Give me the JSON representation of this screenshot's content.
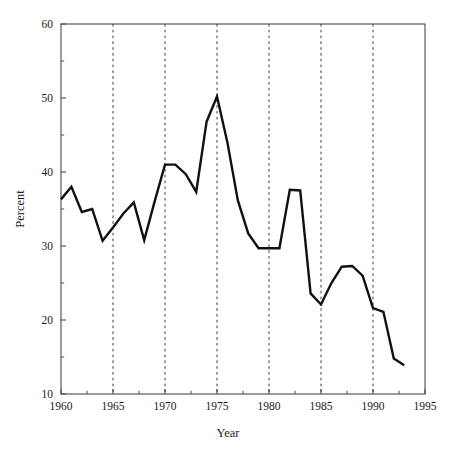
{
  "chart_data": {
    "type": "line",
    "title": "",
    "xlabel": "Year",
    "ylabel": "Percent",
    "xlim": [
      1960,
      1995
    ],
    "ylim": [
      10,
      60
    ],
    "grid": "vertical-dashed-at-major-x-ticks",
    "legend": "none",
    "x_major_ticks": [
      1960,
      1965,
      1970,
      1975,
      1980,
      1985,
      1990,
      1995
    ],
    "x_major_tick_labels": [
      "1960",
      "1965",
      "1970",
      "1975",
      "1980",
      "1985",
      "1990",
      "1995"
    ],
    "x_minor_ticks": [
      1962.5,
      1967.5,
      1972.5,
      1977.5,
      1982.5,
      1987.5,
      1992.5
    ],
    "y_major_ticks": [
      10,
      20,
      30,
      40,
      50,
      60
    ],
    "y_major_tick_labels": [
      "10",
      "20",
      "30",
      "40",
      "50",
      "60"
    ],
    "y_minor_ticks": [
      15,
      25,
      35,
      45,
      55
    ],
    "series": [
      {
        "name": "Percent",
        "color": "#111111",
        "x": [
          1960,
          1961,
          1962,
          1963,
          1964,
          1965,
          1966,
          1967,
          1968,
          1969,
          1970,
          1971,
          1972,
          1973,
          1974,
          1975,
          1976,
          1977,
          1978,
          1979,
          1980,
          1981,
          1982,
          1983,
          1984,
          1985,
          1986,
          1987,
          1988,
          1989,
          1990,
          1991,
          1992,
          1993
        ],
        "values": [
          36.3,
          38.0,
          34.6,
          35.0,
          30.7,
          32.5,
          34.4,
          35.9,
          30.8,
          36.0,
          41.0,
          41.0,
          39.7,
          37.3,
          46.8,
          50.2,
          44.0,
          36.2,
          31.7,
          29.7,
          29.7,
          29.7,
          37.6,
          37.5,
          23.6,
          22.1,
          25.0,
          27.2,
          27.3,
          26.0,
          21.6,
          21.1,
          14.8,
          13.9
        ]
      }
    ]
  },
  "axes": {
    "y_title": "Percent",
    "x_title": "Year"
  }
}
